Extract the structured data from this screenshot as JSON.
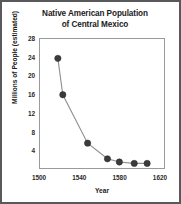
{
  "chart_data": {
    "type": "line",
    "title": "Native American Population of Central Mexico",
    "title_line1": "Native American Population",
    "title_line2": "of Central Mexico",
    "xlabel": "Year",
    "ylabel": "Millions of People (estimated)",
    "xlim": [
      1500,
      1625
    ],
    "ylim": [
      0,
      28
    ],
    "xticks": [
      1500,
      1540,
      1580,
      1620
    ],
    "yticks": [
      4,
      8,
      12,
      16,
      20,
      24,
      28
    ],
    "grid": false,
    "legend": null,
    "marker": "filled-circle",
    "marker_color": "#3b3b3d",
    "line_color": "#8d8d8f",
    "x": [
      1518,
      1523,
      1548,
      1568,
      1580,
      1595,
      1608
    ],
    "values": [
      23.8,
      15.9,
      5.4,
      2.0,
      1.3,
      1.0,
      1.0
    ],
    "points": [
      {
        "x": 1518,
        "y": 23.8
      },
      {
        "x": 1523,
        "y": 15.9
      },
      {
        "x": 1548,
        "y": 5.4
      },
      {
        "x": 1568,
        "y": 2.0
      },
      {
        "x": 1580,
        "y": 1.3
      },
      {
        "x": 1595,
        "y": 1.0
      },
      {
        "x": 1608,
        "y": 1.0
      }
    ]
  },
  "colors": {
    "frame": "#59595b",
    "axis": "#9a9a9a",
    "text": "#1b1b1b",
    "marker": "#3b3b3d",
    "line": "#8d8d8f",
    "background": "#ffffff"
  }
}
